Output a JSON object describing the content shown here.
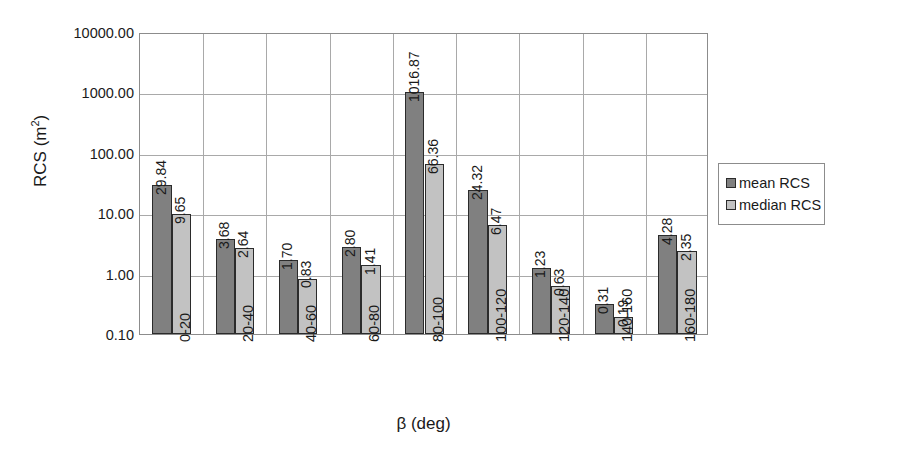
{
  "chart_data": {
    "type": "bar",
    "title": "",
    "xlabel": "β (deg)",
    "ylabel": "RCS (m²)",
    "ylabel_base": "RCS (m",
    "ylabel_sup": "2",
    "ylabel_tail": ")",
    "yscale": "log",
    "ylim": [
      0.1,
      10000
    ],
    "grid": true,
    "legend_position": "right",
    "categories": [
      "0-20",
      "20-40",
      "40-60",
      "60-80",
      "80-100",
      "100-120",
      "120-140",
      "140-160",
      "160-180"
    ],
    "ytick_labels": [
      "10000.00",
      "1000.00",
      "100.00",
      "10.00",
      "1.00",
      "0.10"
    ],
    "ytick_values": [
      10000,
      1000,
      100,
      10,
      1,
      0.1
    ],
    "series": [
      {
        "name": "mean RCS",
        "color": "#808080",
        "values": [
          29.84,
          3.68,
          1.7,
          2.8,
          1016.87,
          24.32,
          1.23,
          0.31,
          4.28
        ],
        "labels": [
          "29.84",
          "3.68",
          "1.70",
          "2.80",
          "1016.87",
          "24.32",
          "1.23",
          "0.31",
          "4.28"
        ]
      },
      {
        "name": "median RCS",
        "color": "#c2c2c2",
        "values": [
          9.65,
          2.64,
          0.83,
          1.41,
          66.36,
          6.47,
          0.63,
          0.19,
          2.35
        ],
        "labels": [
          "9.65",
          "2.64",
          "0.83",
          "1.41",
          "66.36",
          "6.47",
          "0.63",
          "0.19",
          "2.35"
        ]
      }
    ]
  },
  "legend": {
    "items": [
      {
        "label": "mean RCS",
        "swatch": "mean"
      },
      {
        "label": "median RCS",
        "swatch": "median"
      }
    ]
  }
}
